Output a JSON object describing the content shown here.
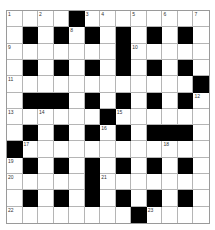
{
  "puzzle": {
    "rows": 13,
    "cols": 13,
    "grid": [
      "....#........",
      ".#.#.#.#.#.#.",
      ".......#.....",
      ".#.#.#.#.#.#.",
      "............#",
      ".###.#.#.#.#.",
      "......#......",
      ".#.#.#.#.###.",
      "#............",
      ".#.#.#.#.#.#.",
      ".....#.......",
      ".#.#.#.#.#.#.",
      "........#...."
    ],
    "numbers": [
      {
        "r": 0,
        "c": 0,
        "n": "1"
      },
      {
        "r": 0,
        "c": 2,
        "n": "2"
      },
      {
        "r": 0,
        "c": 5,
        "n": "3"
      },
      {
        "r": 0,
        "c": 6,
        "n": "4"
      },
      {
        "r": 0,
        "c": 8,
        "n": "5"
      },
      {
        "r": 0,
        "c": 10,
        "n": "6"
      },
      {
        "r": 0,
        "c": 12,
        "n": "7"
      },
      {
        "r": 1,
        "c": 4,
        "n": "8"
      },
      {
        "r": 2,
        "c": 0,
        "n": "9"
      },
      {
        "r": 2,
        "c": 8,
        "n": "10"
      },
      {
        "r": 4,
        "c": 0,
        "n": "11"
      },
      {
        "r": 5,
        "c": 12,
        "n": "12"
      },
      {
        "r": 6,
        "c": 0,
        "n": "13"
      },
      {
        "r": 6,
        "c": 2,
        "n": "14"
      },
      {
        "r": 6,
        "c": 7,
        "n": "15"
      },
      {
        "r": 7,
        "c": 6,
        "n": "16"
      },
      {
        "r": 8,
        "c": 1,
        "n": "17"
      },
      {
        "r": 8,
        "c": 10,
        "n": "18"
      },
      {
        "r": 9,
        "c": 0,
        "n": "19"
      },
      {
        "r": 10,
        "c": 0,
        "n": "20"
      },
      {
        "r": 10,
        "c": 6,
        "n": "21"
      },
      {
        "r": 12,
        "c": 0,
        "n": "22"
      },
      {
        "r": 12,
        "c": 9,
        "n": "23"
      }
    ]
  }
}
